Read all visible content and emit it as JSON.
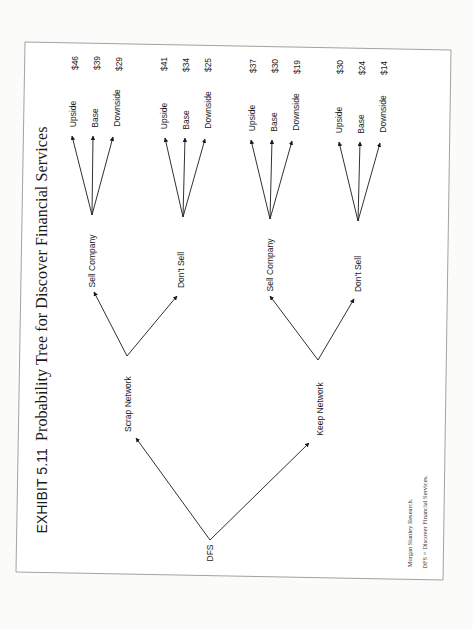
{
  "title": {
    "exhibit": "EXHIBIT 5.11",
    "text": "Probability Tree for Discover Financial Services"
  },
  "root": {
    "label": "DFS"
  },
  "level1": [
    {
      "label": "Scrap Network",
      "children": [
        {
          "label": "Sell Company",
          "outcomes": [
            {
              "label": "Upside",
              "value": "$46"
            },
            {
              "label": "Base",
              "value": "$39"
            },
            {
              "label": "Downside",
              "value": "$29"
            }
          ]
        },
        {
          "label": "Don't Sell",
          "outcomes": [
            {
              "label": "Upside",
              "value": "$41"
            },
            {
              "label": "Base",
              "value": "$34"
            },
            {
              "label": "Downside",
              "value": "$25"
            }
          ]
        }
      ]
    },
    {
      "label": "Keep Network",
      "children": [
        {
          "label": "Sell Company",
          "outcomes": [
            {
              "label": "Upside",
              "value": "$37"
            },
            {
              "label": "Base",
              "value": "$30"
            },
            {
              "label": "Downside",
              "value": "$19"
            }
          ]
        },
        {
          "label": "Don't Sell",
          "outcomes": [
            {
              "label": "Upside",
              "value": "$30"
            },
            {
              "label": "Base",
              "value": "$24"
            },
            {
              "label": "Downside",
              "value": "$14"
            }
          ]
        }
      ]
    }
  ],
  "notes": {
    "source": "Morgan Stanley Research.",
    "abbreviation": "DFS = Discover Financial Services."
  },
  "colors": {
    "line": "#1a1a1a",
    "frame": "#8a8a8a",
    "background": "#fbfbfa"
  }
}
